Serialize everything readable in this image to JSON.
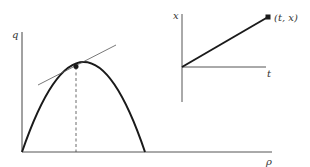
{
  "left_plot": {
    "y_axis_label": "q",
    "x_axis_label": "ρ",
    "curve": "parabola",
    "features": [
      "tangent-line",
      "point-on-curve",
      "dashed-drop-line"
    ]
  },
  "right_plot": {
    "y_axis_label": "x",
    "x_axis_label": "t",
    "point_label": "(t, x)",
    "features": [
      "straight-line-from-origin-offset",
      "endpoint-marker"
    ]
  },
  "colors": {
    "ink": "#1a1a1a",
    "axis": "#444444",
    "background": "#ffffff"
  }
}
